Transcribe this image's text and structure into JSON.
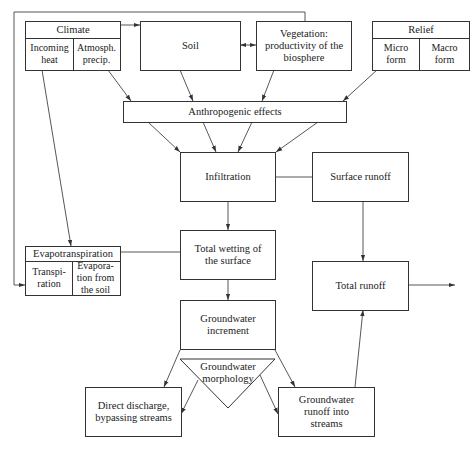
{
  "diagram": {
    "type": "flowchart",
    "nodes": {
      "climate": {
        "title": "Climate",
        "cells": [
          "Incoming heat",
          "Atmosph. precip."
        ]
      },
      "soil": {
        "label": "Soil"
      },
      "vegetation": {
        "label": "Vegetation: productivity of the biosphere"
      },
      "relief": {
        "title": "Relief",
        "cells": [
          "Micro form",
          "Macro form"
        ]
      },
      "anthropogenic": {
        "label": "Anthropogenic effects"
      },
      "infiltration": {
        "label": "Infiltration"
      },
      "surface_runoff": {
        "label": "Surface runoff"
      },
      "evapotranspiration": {
        "title": "Evapotranspiration",
        "cells": [
          "Transpi-ration",
          "Evapora-tion from the soil"
        ]
      },
      "total_wetting": {
        "label": "Total wetting of the surface"
      },
      "total_runoff": {
        "label": "Total runoff"
      },
      "groundwater_increment": {
        "label": "Groundwater increment"
      },
      "groundwater_morphology": {
        "label": "Groundwater morphology"
      },
      "direct_discharge": {
        "label": "Direct discharge, bypassing streams"
      },
      "groundwater_runoff": {
        "label": "Groundwater runoff into streams"
      }
    },
    "edges": [
      [
        "climate",
        "soil"
      ],
      [
        "soil",
        "vegetation",
        "bidirectional"
      ],
      [
        "climate.atmosph_precip",
        "anthropogenic"
      ],
      [
        "soil",
        "anthropogenic"
      ],
      [
        "vegetation",
        "anthropogenic"
      ],
      [
        "relief",
        "anthropogenic"
      ],
      [
        "anthropogenic",
        "infiltration"
      ],
      [
        "infiltration",
        "surface_runoff",
        "line"
      ],
      [
        "climate.incoming_heat",
        "evapotranspiration"
      ],
      [
        "vegetation",
        "evapotranspiration",
        "feedback-loop"
      ],
      [
        "infiltration",
        "total_wetting"
      ],
      [
        "evapotranspiration",
        "total_wetting",
        "line"
      ],
      [
        "surface_runoff",
        "total_runoff"
      ],
      [
        "total_wetting",
        "groundwater_increment"
      ],
      [
        "groundwater_increment",
        "direct_discharge"
      ],
      [
        "groundwater_increment",
        "groundwater_runoff"
      ],
      [
        "groundwater_morphology",
        "direct_discharge"
      ],
      [
        "groundwater_morphology",
        "groundwater_runoff"
      ],
      [
        "groundwater_runoff",
        "total_runoff"
      ],
      [
        "total_runoff",
        "out"
      ]
    ]
  }
}
